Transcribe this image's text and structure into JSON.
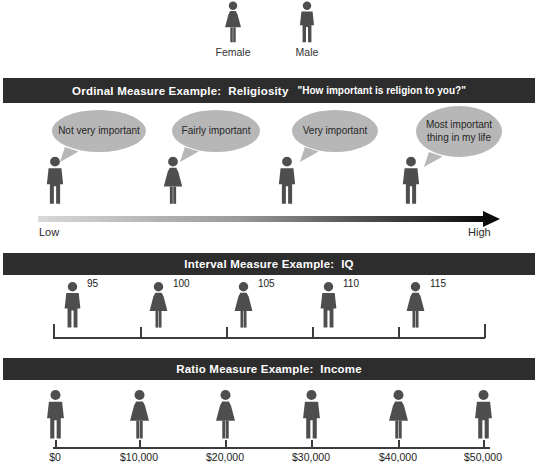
{
  "colors": {
    "band_bg": "#2d2d2d",
    "band_text": "#ffffff",
    "icon_fill": "#4e4e4e",
    "bubble_fill": "#b7b7b7",
    "axis_line": "#3b3b3b",
    "arrow_gradient_start": "#d9d9d9",
    "arrow_gradient_end": "#0c0c0c"
  },
  "legend": {
    "items": [
      {
        "gender": "female",
        "label": "Female"
      },
      {
        "gender": "male",
        "label": "Male"
      }
    ]
  },
  "ordinal": {
    "header": "Ordinal Measure Example:  Religiosity",
    "quote": "\"How important is religion to you?\"",
    "persons": [
      {
        "gender": "male",
        "bubble": "Not very important"
      },
      {
        "gender": "female",
        "bubble": "Fairly important"
      },
      {
        "gender": "male",
        "bubble": "Very important"
      },
      {
        "gender": "male",
        "bubble": "Most important thing in my life"
      }
    ],
    "axis": {
      "low": "Low",
      "high": "High"
    }
  },
  "interval": {
    "header": "Interval Measure Example:  IQ",
    "persons": [
      {
        "gender": "male",
        "value": "95"
      },
      {
        "gender": "female",
        "value": "100"
      },
      {
        "gender": "female",
        "value": "105"
      },
      {
        "gender": "male",
        "value": "110"
      },
      {
        "gender": "female",
        "value": "115"
      }
    ]
  },
  "ratio": {
    "header": "Ratio Measure Example:  Income",
    "persons": [
      {
        "gender": "male",
        "value": "$0"
      },
      {
        "gender": "female",
        "value": "$10,000"
      },
      {
        "gender": "female",
        "value": "$20,000"
      },
      {
        "gender": "male",
        "value": "$30,000"
      },
      {
        "gender": "female",
        "value": "$40,000"
      },
      {
        "gender": "male",
        "value": "$50,000"
      }
    ]
  }
}
